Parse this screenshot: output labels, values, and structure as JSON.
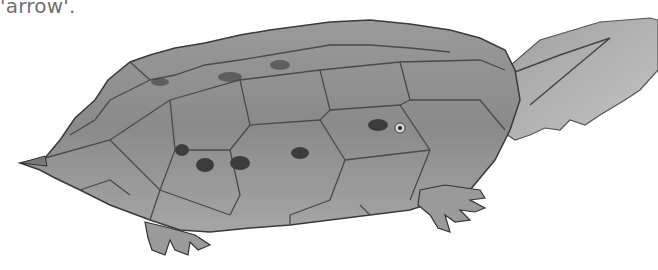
{
  "caption": {
    "text": "'arrow'."
  },
  "illustration": {
    "subject": "turtle shell pencil drawing",
    "palette": {
      "background": "#ffffff",
      "shell_light": "#b8b8b8",
      "shell_mid": "#8f8f8f",
      "shell_dark": "#5a5a5a",
      "outline": "#3a3a3a",
      "spots": "#3c3c3c",
      "text": "#707070"
    }
  }
}
